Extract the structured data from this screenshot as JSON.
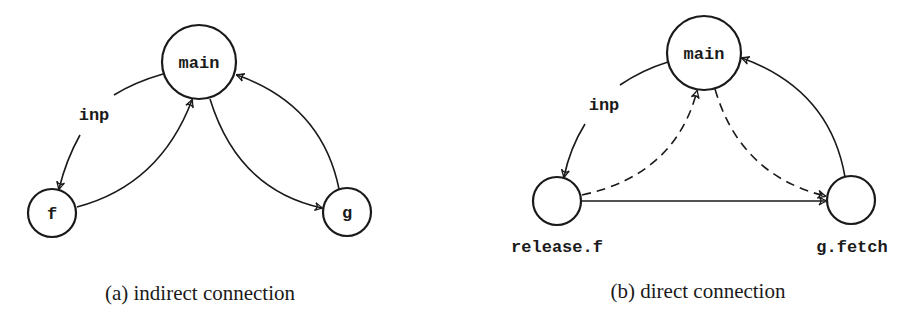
{
  "panel_a": {
    "nodes": {
      "main": "main",
      "f": "f",
      "g": "g"
    },
    "edge_label": "inp",
    "caption": "(a) indirect connection"
  },
  "panel_b": {
    "nodes": {
      "main": "main",
      "release_f": "",
      "g_fetch": ""
    },
    "node_labels": {
      "release_f": "release.f",
      "g_fetch": "g.fetch"
    },
    "edge_label": "inp",
    "caption": "(b) direct connection"
  },
  "colors": {
    "stroke": "#1a1a1a",
    "background": "#ffffff"
  }
}
